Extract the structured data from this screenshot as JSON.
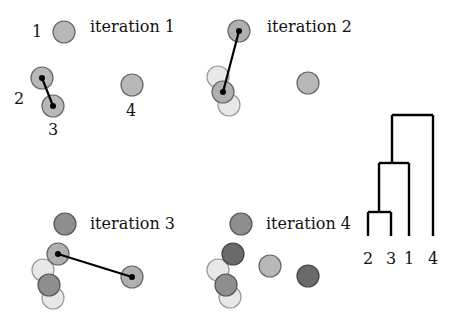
{
  "panels": [
    {
      "title": "iteration 1",
      "title_pos": [
        90,
        32
      ],
      "circles": [
        {
          "x": 64,
          "y": 32,
          "fill": "#b8b8b8",
          "stroke": "#666"
        },
        {
          "x": 42,
          "y": 78,
          "fill": "#b8b8b8",
          "stroke": "#666"
        },
        {
          "x": 53,
          "y": 106,
          "fill": "#b8b8b8",
          "stroke": "#666"
        },
        {
          "x": 132,
          "y": 85,
          "fill": "#b8b8b8",
          "stroke": "#666"
        }
      ],
      "links": [
        {
          "x1": 42,
          "y1": 78,
          "x2": 53,
          "y2": 106
        }
      ],
      "point_labels": [
        {
          "text": "1",
          "x": 37,
          "y": 37
        },
        {
          "text": "2",
          "x": 19,
          "y": 104
        },
        {
          "text": "3",
          "x": 53,
          "y": 135
        },
        {
          "text": "4",
          "x": 131,
          "y": 116
        }
      ]
    },
    {
      "title": "iteration 2",
      "title_pos": [
        267,
        32
      ],
      "circles": [
        {
          "x": 218,
          "y": 77,
          "fill": "#e8e8e8",
          "stroke": "#999"
        },
        {
          "x": 229,
          "y": 105,
          "fill": "#e8e8e8",
          "stroke": "#999"
        },
        {
          "x": 223,
          "y": 92,
          "fill": "#b0b0b0",
          "stroke": "#666"
        },
        {
          "x": 239,
          "y": 31,
          "fill": "#b0b0b0",
          "stroke": "#666"
        },
        {
          "x": 308,
          "y": 83,
          "fill": "#b8b8b8",
          "stroke": "#666"
        }
      ],
      "links": [
        {
          "x1": 239,
          "y1": 31,
          "x2": 223,
          "y2": 92
        }
      ],
      "point_labels": []
    },
    {
      "title": "iteration 3",
      "title_pos": [
        90,
        229
      ],
      "circles": [
        {
          "x": 65,
          "y": 224,
          "fill": "#8e8e8e",
          "stroke": "#555"
        },
        {
          "x": 43,
          "y": 270,
          "fill": "#e8e8e8",
          "stroke": "#999"
        },
        {
          "x": 53,
          "y": 298,
          "fill": "#e8e8e8",
          "stroke": "#999"
        },
        {
          "x": 49,
          "y": 285,
          "fill": "#8e8e8e",
          "stroke": "#555"
        },
        {
          "x": 58,
          "y": 254,
          "fill": "#b0b0b0",
          "stroke": "#666"
        },
        {
          "x": 132,
          "y": 277,
          "fill": "#b0b0b0",
          "stroke": "#666"
        }
      ],
      "links": [
        {
          "x1": 58,
          "y1": 254,
          "x2": 132,
          "y2": 277
        }
      ],
      "point_labels": []
    },
    {
      "title": "iteration 4",
      "title_pos": [
        266,
        229
      ],
      "circles": [
        {
          "x": 241,
          "y": 224,
          "fill": "#8e8e8e",
          "stroke": "#555"
        },
        {
          "x": 218,
          "y": 270,
          "fill": "#e8e8e8",
          "stroke": "#999"
        },
        {
          "x": 230,
          "y": 297,
          "fill": "#e8e8e8",
          "stroke": "#999"
        },
        {
          "x": 233,
          "y": 254,
          "fill": "#6a6a6a",
          "stroke": "#444"
        },
        {
          "x": 226,
          "y": 285,
          "fill": "#8e8e8e",
          "stroke": "#555"
        },
        {
          "x": 270,
          "y": 266,
          "fill": "#b8b8b8",
          "stroke": "#666"
        },
        {
          "x": 308,
          "y": 276,
          "fill": "#6a6a6a",
          "stroke": "#444"
        }
      ],
      "links": [],
      "point_labels": []
    }
  ],
  "dendrogram": {
    "leaves": [
      {
        "label": "2",
        "x": 368
      },
      {
        "label": "3",
        "x": 391
      },
      {
        "label": "1",
        "x": 409
      },
      {
        "label": "4",
        "x": 433
      }
    ],
    "base_y": 236,
    "label_y": 264,
    "merges": [
      {
        "left_x": 368,
        "right_x": 391,
        "y": 212,
        "mid_x": 379
      },
      {
        "left_x": 379,
        "right_x": 409,
        "y": 163,
        "mid_x": 392
      },
      {
        "left_x": 392,
        "right_x": 433,
        "y": 115
      }
    ]
  }
}
